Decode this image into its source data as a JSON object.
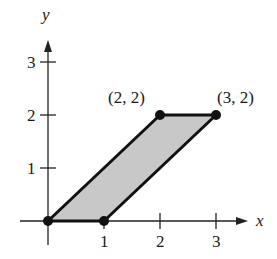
{
  "diagram": {
    "type": "parallelogram-on-axes",
    "axes": {
      "x_label": "x",
      "y_label": "y",
      "x_ticks": [
        "1",
        "2",
        "3"
      ],
      "y_ticks": [
        "1",
        "2",
        "3"
      ]
    },
    "vertices": [
      {
        "x": 0,
        "y": 0,
        "label": ""
      },
      {
        "x": 1,
        "y": 0,
        "label": ""
      },
      {
        "x": 3,
        "y": 2,
        "label": "(3, 2)"
      },
      {
        "x": 2,
        "y": 2,
        "label": "(2, 2)"
      }
    ],
    "fill_color": "#c8c8c8",
    "stroke_color": "#111111"
  }
}
